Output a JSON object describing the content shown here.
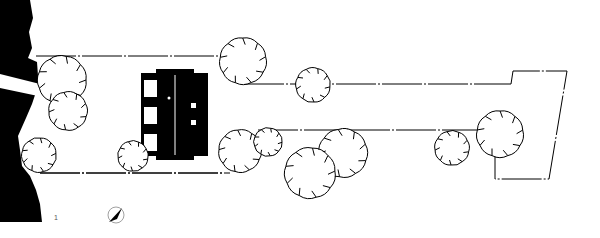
{
  "drawing": {
    "type": "site-plan",
    "sheet_number": "1",
    "colors": {
      "ink": "#000000",
      "paper": "#ffffff",
      "label": "#555555"
    }
  },
  "site": {
    "terrain_region": "dark-woodland-left",
    "path_stripe": "white-access-path",
    "boundary_lines": [
      {
        "name": "lot-top",
        "y": 56,
        "x1": 36,
        "x2": 222
      },
      {
        "name": "lot-bottom",
        "y": 173,
        "x1": 40,
        "x2": 222
      },
      {
        "name": "drive-top",
        "y": 84,
        "x1": 244,
        "x2": 511
      },
      {
        "name": "drive-bottom",
        "y": 130,
        "x1": 280,
        "x2": 480
      }
    ]
  },
  "building": {
    "name": "house",
    "windows": 3,
    "skylights": 2
  },
  "trees": [
    {
      "id": "t1",
      "cx": 62,
      "cy": 80,
      "r": 24
    },
    {
      "id": "t2",
      "cx": 68,
      "cy": 111,
      "r": 19
    },
    {
      "id": "t3",
      "cx": 39,
      "cy": 155,
      "r": 17
    },
    {
      "id": "t4",
      "cx": 133,
      "cy": 156,
      "r": 15
    },
    {
      "id": "t5",
      "cx": 243,
      "cy": 61,
      "r": 23
    },
    {
      "id": "t6",
      "cx": 313,
      "cy": 85,
      "r": 17
    },
    {
      "id": "t7",
      "cx": 240,
      "cy": 151,
      "r": 21
    },
    {
      "id": "t8",
      "cx": 268,
      "cy": 142,
      "r": 14
    },
    {
      "id": "t9",
      "cx": 343,
      "cy": 153,
      "r": 24
    },
    {
      "id": "t10",
      "cx": 310,
      "cy": 173,
      "r": 25
    },
    {
      "id": "t11",
      "cx": 452,
      "cy": 148,
      "r": 17
    },
    {
      "id": "t12",
      "cx": 500,
      "cy": 134,
      "r": 23
    }
  ],
  "north_arrow": {
    "cx": 116,
    "cy": 215,
    "r": 8
  }
}
